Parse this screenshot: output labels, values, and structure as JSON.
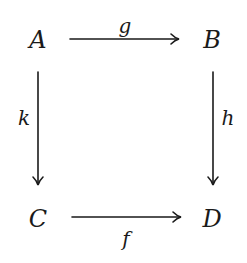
{
  "diagram": {
    "type": "commutative-square",
    "nodes": [
      {
        "id": "A",
        "label": "A",
        "x": 38,
        "y": 40
      },
      {
        "id": "B",
        "label": "B",
        "x": 212,
        "y": 40
      },
      {
        "id": "C",
        "label": "C",
        "x": 38,
        "y": 219
      },
      {
        "id": "D",
        "label": "D",
        "x": 212,
        "y": 219
      }
    ],
    "edges": [
      {
        "from": "A",
        "to": "B",
        "label": "g",
        "label_position": "above"
      },
      {
        "from": "A",
        "to": "C",
        "label": "k",
        "label_position": "left"
      },
      {
        "from": "B",
        "to": "D",
        "label": "h",
        "label_position": "right"
      },
      {
        "from": "C",
        "to": "D",
        "label": "f",
        "label_position": "below"
      }
    ],
    "colors": {
      "stroke": "#1a1a1a",
      "background": "#ffffff"
    }
  }
}
